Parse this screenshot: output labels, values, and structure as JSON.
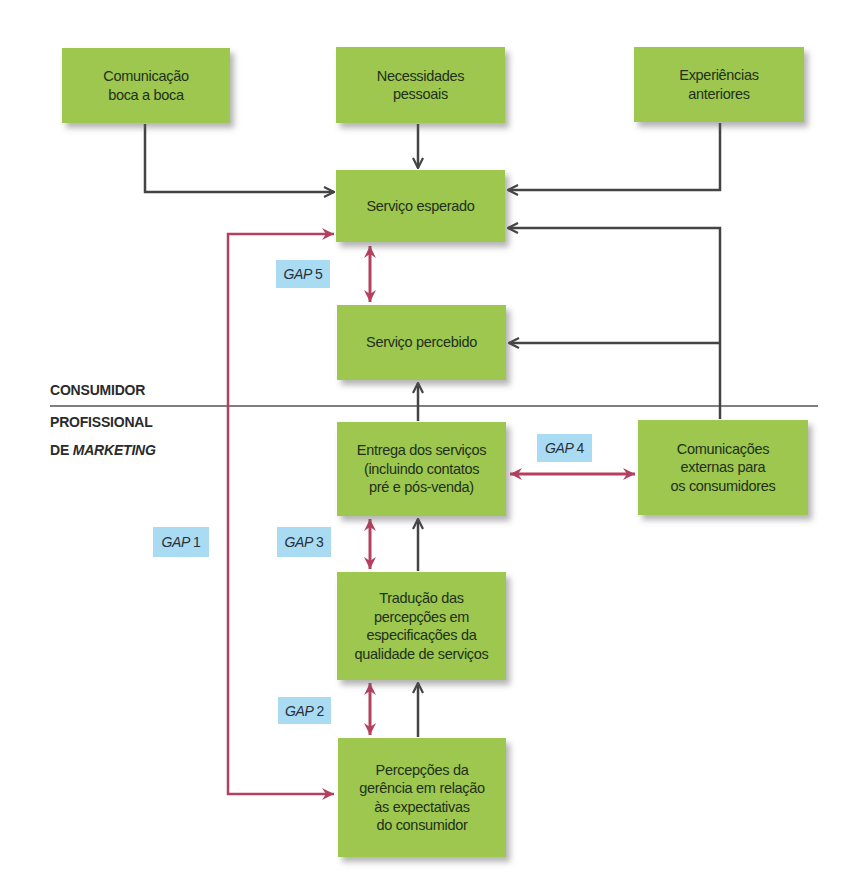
{
  "colors": {
    "box_fill": "#9dc74f",
    "gap_label_fill": "#a9dcf2",
    "flow_arrow": "#444444",
    "gap_arrow": "#b3405f",
    "divider": "#555555"
  },
  "boxes": {
    "word_of_mouth": "Comunicação\nboca a boca",
    "personal_needs": "Necessidades\npessoais",
    "past_experience": "Experiências\nanteriores",
    "expected_service": "Serviço esperado",
    "perceived_service": "Serviço percebido",
    "service_delivery": "Entrega dos serviços\n(incluindo contatos\npré e pós-venda)",
    "external_communications": "Comunicações\nexternas para\nos consumidores",
    "translation_specs": "Tradução das\npercepções em\nespecificações da\nqualidade de serviços",
    "management_perceptions": "Percepções da\ngerência em relação\nàs expectativas\ndo consumidor"
  },
  "gaps": {
    "gap1": {
      "prefix": "GAP",
      "number": "1"
    },
    "gap2": {
      "prefix": "GAP",
      "number": "2"
    },
    "gap3": {
      "prefix": "GAP",
      "number": "3"
    },
    "gap4": {
      "prefix": "GAP",
      "number": "4"
    },
    "gap5": {
      "prefix": "GAP",
      "number": "5"
    }
  },
  "sections": {
    "consumer": "CONSUMIDOR",
    "marketer_line1": "PROFISSIONAL",
    "marketer_line2_prefix": "DE ",
    "marketer_line2_italic": "MARKETING"
  }
}
